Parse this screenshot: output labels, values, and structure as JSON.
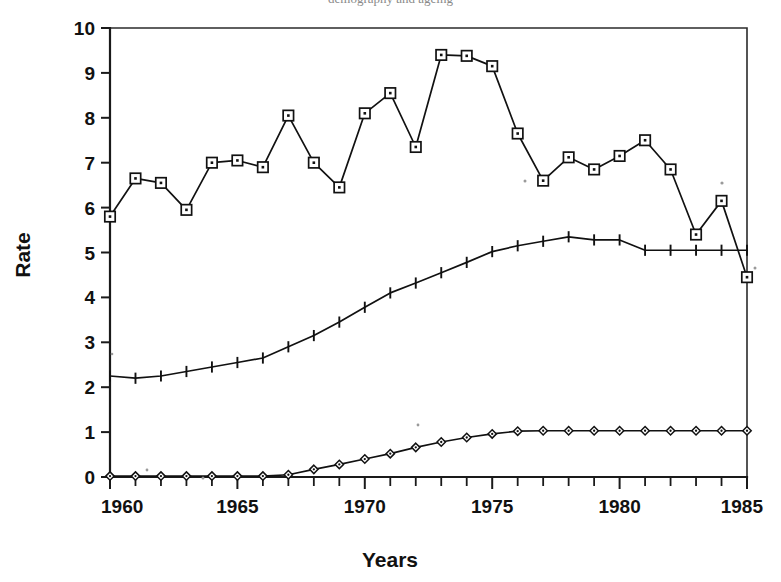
{
  "figure": {
    "background_color": "#ffffff",
    "ink_color": "#111111",
    "clipped_header_text": "demography and ageing"
  },
  "axes": {
    "y_title": "Rate",
    "x_title": "Years",
    "y_tick_labels": [
      "0",
      "1",
      "2",
      "3",
      "4",
      "5",
      "6",
      "7",
      "8",
      "9",
      "10"
    ],
    "x_tick_labels": [
      "1960",
      "1965",
      "1970",
      "1975",
      "1980",
      "1985"
    ]
  },
  "chart_data": {
    "type": "line",
    "title": "",
    "xlabel": "Years",
    "ylabel": "Rate",
    "xlim": [
      1960,
      1985
    ],
    "ylim": [
      0,
      10
    ],
    "x_major_ticks": [
      1960,
      1965,
      1970,
      1975,
      1980,
      1985
    ],
    "x_minor_tick_step": 1,
    "y_ticks": [
      0,
      1,
      2,
      3,
      4,
      5,
      6,
      7,
      8,
      9,
      10
    ],
    "grid": false,
    "legend": "none",
    "x": [
      1960,
      1961,
      1962,
      1963,
      1964,
      1965,
      1966,
      1967,
      1968,
      1969,
      1970,
      1971,
      1972,
      1973,
      1974,
      1975,
      1976,
      1977,
      1978,
      1979,
      1980,
      1981,
      1982,
      1983,
      1984,
      1985
    ],
    "series": [
      {
        "name": "series-square",
        "marker": "square",
        "values": [
          5.8,
          6.65,
          6.55,
          5.95,
          7.0,
          7.05,
          6.9,
          8.05,
          7.0,
          6.45,
          8.1,
          8.55,
          7.35,
          9.4,
          9.38,
          9.15,
          7.65,
          6.6,
          7.12,
          6.85,
          7.15,
          7.5,
          6.85,
          5.4,
          6.15,
          4.45
        ]
      },
      {
        "name": "series-plus",
        "marker": "plus",
        "values": [
          2.25,
          2.2,
          2.25,
          2.35,
          2.45,
          2.55,
          2.65,
          2.9,
          3.15,
          3.45,
          3.78,
          4.1,
          4.32,
          4.55,
          4.78,
          5.02,
          5.15,
          5.25,
          5.35,
          5.28,
          5.28,
          5.05,
          5.05,
          5.05,
          5.05,
          5.05
        ]
      },
      {
        "name": "series-diamond",
        "marker": "diamond",
        "values": [
          0.02,
          0.02,
          0.02,
          0.02,
          0.02,
          0.02,
          0.02,
          0.05,
          0.17,
          0.28,
          0.4,
          0.52,
          0.66,
          0.78,
          0.88,
          0.96,
          1.02,
          1.03,
          1.03,
          1.03,
          1.03,
          1.03,
          1.03,
          1.03,
          1.03,
          1.03
        ]
      }
    ]
  }
}
